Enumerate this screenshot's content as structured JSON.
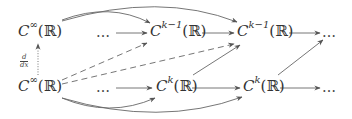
{
  "diagram": {
    "type": "commutative-diagram",
    "nodes": {
      "top_left": {
        "base": "C",
        "sup": "∞",
        "arg": "(ℝ)"
      },
      "top_dots_1": "…",
      "top_mid": {
        "base": "C",
        "sup": "k−1",
        "arg": "(ℝ)"
      },
      "top_right": {
        "base": "C",
        "sup": "k−1",
        "arg": "(ℝ)"
      },
      "top_dots_2": "…",
      "bottom_left": {
        "base": "C",
        "sup": "∞",
        "arg": "(ℝ)"
      },
      "bottom_dots_1": "…",
      "bottom_mid": {
        "base": "C",
        "sup": "k",
        "arg": "(ℝ)"
      },
      "bottom_right": {
        "base": "C",
        "sup": "k",
        "arg": "(ℝ)"
      },
      "bottom_dots_2": "…"
    },
    "vertical_label": {
      "numerator": "d",
      "denominator": "dx"
    },
    "arrows": [
      {
        "from": "bottom_left",
        "to": "top_left",
        "style": "dotted",
        "label": "d/dx"
      },
      {
        "from": "top_dots_1",
        "to": "top_mid",
        "style": "solid"
      },
      {
        "from": "top_mid",
        "to": "top_right",
        "style": "solid"
      },
      {
        "from": "top_right",
        "to": "top_dots_2",
        "style": "solid"
      },
      {
        "from": "bottom_dots_1",
        "to": "bottom_mid",
        "style": "solid"
      },
      {
        "from": "bottom_mid",
        "to": "bottom_right",
        "style": "solid"
      },
      {
        "from": "bottom_right",
        "to": "bottom_dots_2",
        "style": "solid"
      },
      {
        "from": "top_left",
        "to": "top_mid",
        "style": "curved-solid"
      },
      {
        "from": "top_left",
        "to": "top_right",
        "style": "curved-solid"
      },
      {
        "from": "bottom_left",
        "to": "bottom_mid",
        "style": "curved-solid"
      },
      {
        "from": "bottom_left",
        "to": "bottom_right",
        "style": "curved-solid"
      },
      {
        "from": "bottom_left",
        "to": "top_mid",
        "style": "dashed"
      },
      {
        "from": "bottom_left",
        "to": "top_right",
        "style": "dashed"
      },
      {
        "from": "bottom_mid",
        "to": "top_right",
        "style": "solid"
      },
      {
        "from": "bottom_right",
        "to": "top_dots_2",
        "style": "solid"
      }
    ],
    "colors": {
      "stroke": "#555555",
      "text": "#333333"
    }
  }
}
